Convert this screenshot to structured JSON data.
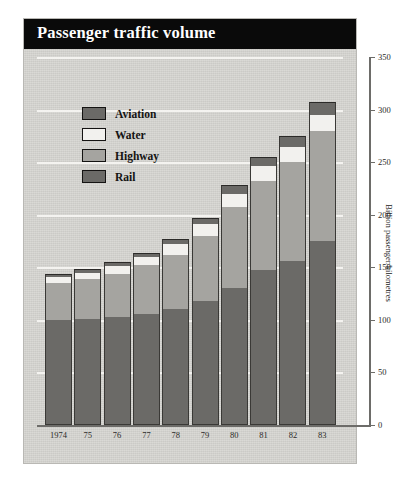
{
  "figure": {
    "title": "Passenger traffic volume",
    "background_color": "#d7d6d2",
    "title_bar_color": "#0a0a0a",
    "title_text_color": "#ffffff"
  },
  "legend": {
    "position": "inside-top-left",
    "items": [
      {
        "label": "Aviation",
        "color": "#6b6a67"
      },
      {
        "label": "Water",
        "color": "#f2f1ee"
      },
      {
        "label": "Highway",
        "color": "#a5a4a0"
      },
      {
        "label": "Rail",
        "color": "#6b6a67"
      }
    ]
  },
  "axes": {
    "y_label": "Billion passenger/kilometres",
    "y_ticks": [
      "0",
      "50",
      "100",
      "150",
      "200",
      "250",
      "300",
      "350"
    ],
    "y_axis_side": "right",
    "x_ticks": [
      "1974",
      "75",
      "76",
      "77",
      "78",
      "79",
      "80",
      "81",
      "82",
      "83"
    ]
  },
  "chart_data": {
    "type": "bar",
    "subtype": "stacked-column",
    "title": "Passenger traffic volume",
    "xlabel": "",
    "ylabel": "Billion passenger/kilometres",
    "ylim": [
      0,
      350
    ],
    "ytick_step": 50,
    "grid": "horizontal-white-lines",
    "legend_position": "inside top-left",
    "categories": [
      "1974",
      "75",
      "76",
      "77",
      "78",
      "79",
      "80",
      "81",
      "82",
      "83"
    ],
    "series": [
      {
        "name": "Rail",
        "color": "#6b6a67",
        "values": [
          100,
          101,
          103,
          106,
          110,
          118,
          130,
          147,
          156,
          175
        ]
      },
      {
        "name": "Highway",
        "color": "#a5a4a0",
        "values": [
          35,
          38,
          41,
          46,
          52,
          62,
          77,
          85,
          94,
          105
        ]
      },
      {
        "name": "Water",
        "color": "#f2f1ee",
        "values": [
          6,
          6,
          7,
          8,
          10,
          11,
          13,
          14,
          14,
          15
        ]
      },
      {
        "name": "Aviation",
        "color": "#6b6a67",
        "values": [
          3,
          3,
          4,
          4,
          5,
          6,
          8,
          9,
          11,
          12
        ]
      }
    ],
    "totals": [
      144,
      148,
      155,
      164,
      177,
      197,
      228,
      255,
      275,
      307
    ],
    "stack_order_bottom_to_top": [
      "Rail",
      "Highway",
      "Water",
      "Aviation"
    ]
  }
}
